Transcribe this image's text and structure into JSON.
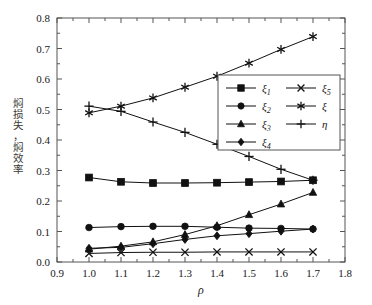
{
  "chart_data": {
    "type": "line",
    "title": "",
    "xlabel": "ρ",
    "ylabel": "焖损失，焖效率",
    "xlim": [
      0.9,
      1.8
    ],
    "ylim": [
      0.0,
      0.8
    ],
    "xticks": [
      "0.9",
      "1.0",
      "1.1",
      "1.2",
      "1.3",
      "1.4",
      "1.5",
      "1.6",
      "1.7",
      "1.8"
    ],
    "yticks": [
      "0.0",
      "0.1",
      "0.2",
      "0.3",
      "0.4",
      "0.5",
      "0.6",
      "0.7",
      "0.8"
    ],
    "xtick_values": [
      0.9,
      1.0,
      1.1,
      1.2,
      1.3,
      1.4,
      1.5,
      1.6,
      1.7,
      1.8
    ],
    "ytick_values": [
      0.0,
      0.1,
      0.2,
      0.3,
      0.4,
      0.5,
      0.6,
      0.7,
      0.8
    ],
    "minor_tick_step_x": 0.05,
    "minor_tick_step_y": 0.05,
    "grid": false,
    "legend_position": "center-right",
    "x": [
      1.0,
      1.1,
      1.2,
      1.3,
      1.4,
      1.5,
      1.6,
      1.7
    ],
    "series": [
      {
        "name": "ξ1",
        "label": "ξ",
        "subscript": "1",
        "marker": "square",
        "values": [
          0.277,
          0.263,
          0.259,
          0.259,
          0.26,
          0.262,
          0.264,
          0.268
        ]
      },
      {
        "name": "ξ2",
        "label": "ξ",
        "subscript": "2",
        "marker": "circle",
        "values": [
          0.113,
          0.116,
          0.117,
          0.117,
          0.114,
          0.111,
          0.11,
          0.108
        ]
      },
      {
        "name": "ξ3",
        "label": "ξ",
        "subscript": "3",
        "marker": "triangle",
        "values": [
          0.042,
          0.052,
          0.066,
          0.09,
          0.119,
          0.155,
          0.19,
          0.228
        ]
      },
      {
        "name": "ξ4",
        "label": "ξ",
        "subscript": "4",
        "marker": "diamond",
        "values": [
          0.045,
          0.048,
          0.06,
          0.074,
          0.086,
          0.093,
          0.101,
          0.108
        ]
      },
      {
        "name": "ξ5",
        "label": "ξ",
        "subscript": "5",
        "marker": "cross",
        "values": [
          0.028,
          0.031,
          0.032,
          0.032,
          0.033,
          0.033,
          0.033,
          0.033
        ]
      },
      {
        "name": "ξ",
        "label": "ξ",
        "subscript": "",
        "marker": "asterisk",
        "values": [
          0.489,
          0.511,
          0.538,
          0.573,
          0.609,
          0.652,
          0.697,
          0.739
        ]
      },
      {
        "name": "η",
        "label": "η",
        "subscript": "",
        "marker": "plus",
        "values": [
          0.511,
          0.494,
          0.459,
          0.425,
          0.386,
          0.346,
          0.304,
          0.268
        ]
      }
    ],
    "legend_entries": [
      {
        "label": "ξ",
        "subscript": "1",
        "marker": "square"
      },
      {
        "label": "ξ",
        "subscript": "5",
        "marker": "cross"
      },
      {
        "label": "ξ",
        "subscript": "2",
        "marker": "circle"
      },
      {
        "label": "ξ",
        "subscript": "",
        "marker": "asterisk"
      },
      {
        "label": "ξ",
        "subscript": "3",
        "marker": "triangle"
      },
      {
        "label": "η",
        "subscript": "",
        "marker": "plus"
      },
      {
        "label": "ξ",
        "subscript": "4",
        "marker": "diamond"
      }
    ],
    "colors": {
      "line": "#111111",
      "marker": "#111111",
      "frame": "#555555",
      "background": "#ffffff"
    }
  }
}
